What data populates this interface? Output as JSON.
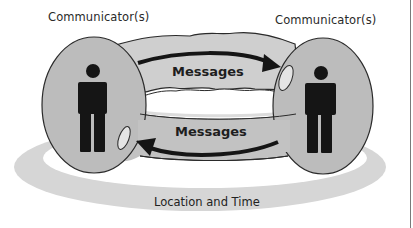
{
  "diagram": {
    "communicators": [
      {
        "id": "left",
        "label": "Communicator(s)"
      },
      {
        "id": "right",
        "label": "Communicator(s)"
      }
    ],
    "messages": [
      {
        "id": "top",
        "label": "Messages",
        "direction": "left-to-right"
      },
      {
        "id": "bottom",
        "label": "Messages",
        "direction": "right-to-left"
      }
    ],
    "context": {
      "label": "Location and Time"
    },
    "colors": {
      "ellipse_fill": "#bcbcbc",
      "tube_fill": "#cfcfcf",
      "ring_fill": "#d6d6d6",
      "figure": "#151515",
      "outline": "#2a2a2a",
      "background": "#ffffff"
    }
  }
}
